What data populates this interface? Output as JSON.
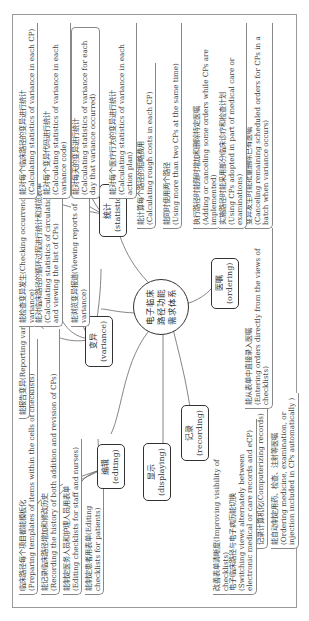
{
  "center": {
    "line1": "电子临床",
    "line2": "路径功能",
    "line3": "需求体系"
  },
  "categories": {
    "editing": {
      "cn": "编辑",
      "en": "(editing)"
    },
    "variance": {
      "cn": "变异",
      "en": "(variance)"
    },
    "statistics": {
      "cn": "统计",
      "en": "(statistics)"
    },
    "displaying": {
      "cn": "显示",
      "en": "(displaying)"
    },
    "recording": {
      "cn": "记录",
      "en": "(recording)"
    },
    "ordering": {
      "cn": "医嘱",
      "en": "(ordering)"
    }
  },
  "editing_items": [
    {
      "cn": "临床路径每个项目都能模板化",
      "en": "(Preparing templates of items within the cells of checklists)"
    },
    {
      "cn": "能记录临床路径增加和修改历史",
      "en": "(Recording the history of both addition and revision of CPs)"
    },
    {
      "cn": "能制定医务人员和护理人员用表单",
      "en": "(Editing checklists for staff and nurses)"
    },
    {
      "cn": "能制定患者用表单(Editing checklists for patients)",
      "en": ""
    }
  ],
  "variance_items": [
    {
      "cn": "能报告变异(Reporting variance)",
      "en": ""
    },
    {
      "cn": "能检查变异发生(Checking occurrence of variance)",
      "en": ""
    },
    {
      "cn": "能对临床路径的循环过程进行统计和浏览表单",
      "en": "(Calculating statistics of circulation of CPs and viewing the list of CPs)"
    },
    {
      "cn": "能浏览变异报道(Viewing reports of variance)",
      "en": ""
    }
  ],
  "statistics_items": [
    {
      "cn": "能对每个临床路径的变异进行统计",
      "en": "(Calculating statistics of variance in each CP)"
    },
    {
      "cn": "能对每个变异代码进行统计",
      "en": "(Calculating statistics of variance in each variance code)"
    },
    {
      "cn": "能对每天的变异进行统计",
      "en": "(Calculating statistics of variance for each day that variance occurred)"
    },
    {
      "cn": "能对每个医疗行为的变异进行统计",
      "en": "(Calculating statistics of variance in each action plan)"
    }
  ],
  "displaying_items": [
    {
      "cn": "改善表单清晰度(Improving visibility of checklists)",
      "en": ""
    },
    {
      "cn": "电子临床路径与电子病历能切换",
      "en": "(Switching views alternately between electronic medical or care records and eCP)"
    }
  ],
  "recording_items": [
    {
      "cn": "记录计算机化(Computerizing records)",
      "en": ""
    },
    {
      "cn": "能自动制定用药、检查、注射等医嘱",
      "en": "(Ordering medicine, examination, or injection included in CPs automatically )"
    }
  ],
  "ordering_items": [
    {
      "cn": "能从表单中直接录入医嘱",
      "en": "(Entering orders directly from the views of checklists)"
    },
    {
      "cn": "变异发生时能批量删除已有医嘱",
      "en": "(Canceling remaining scheduled orders for CPs in a batch when variance occurs)"
    },
    {
      "cn": "执行路径时能随时增加和删除特定医嘱",
      "en": "(Adding or canceling some orders while CPs are implemented)"
    },
    {
      "cn": "能同时使用两个路径",
      "en": "(Using more than two CPs at the same time)"
    },
    {
      "cn": "实施路径时能采用部分临床诊疗和检查计划",
      "en": "(Using CPs adopted in part of medical care or examinations)"
    },
    {
      "cn": "能计算每个路径的粗略费用",
      "en": "(Calculating rough costs in each CP)"
    }
  ]
}
